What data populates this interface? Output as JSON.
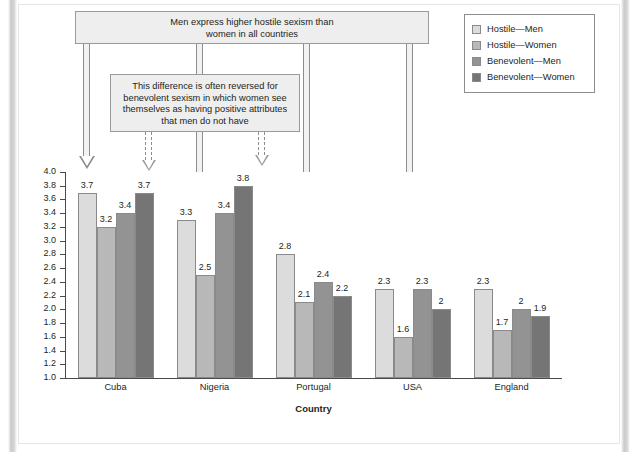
{
  "chart_data": {
    "type": "bar",
    "title": "",
    "xlabel": "Country",
    "ylabel": "Hostile and Benevolent Sexism",
    "categories": [
      "Cuba",
      "Nigeria",
      "Portugal",
      "USA",
      "England"
    ],
    "ylim": [
      1.0,
      4.0
    ],
    "ytick_step": 0.2,
    "yticks": [
      "4.0",
      "3.8",
      "3.6",
      "3.4",
      "3.2",
      "3.0",
      "2.8",
      "2.6",
      "2.4",
      "2.2",
      "2.0",
      "1.8",
      "1.6",
      "1.4",
      "1.2",
      "1.0"
    ],
    "grid": false,
    "legend_position": "top-right",
    "series": [
      {
        "name": "Hostile—Men",
        "color": "#dcdcdc",
        "values": [
          3.7,
          3.3,
          2.8,
          2.3,
          2.3
        ],
        "labels": [
          "3.7",
          "3.3",
          "2.8",
          "2.3",
          "2.3"
        ]
      },
      {
        "name": "Hostile—Women",
        "color": "#b8b8b8",
        "values": [
          3.2,
          2.5,
          2.1,
          1.6,
          1.7
        ],
        "labels": [
          "3.2",
          "2.5",
          "2.1",
          "1.6",
          "1.7"
        ]
      },
      {
        "name": "Benevolent—Men",
        "color": "#939393",
        "values": [
          3.4,
          3.4,
          2.4,
          2.3,
          2.0
        ],
        "labels": [
          "3.4",
          "3.4",
          "2.4",
          "2.3",
          "2"
        ]
      },
      {
        "name": "Benevolent—Women",
        "color": "#757575",
        "values": [
          3.7,
          3.8,
          2.2,
          2.0,
          1.9
        ],
        "labels": [
          "3.7",
          "3.8",
          "2.2",
          "2",
          "1.9"
        ]
      }
    ],
    "annotations": [
      {
        "id": "callout-top",
        "text": "Men express higher hostile sexism than women in all countries"
      },
      {
        "id": "callout-second",
        "text": "This difference is often reversed for benevolent sexism in which women see themselves as having positive attributes that men do not have"
      }
    ]
  },
  "callouts": {
    "top_line1": "Men express higher hostile sexism than",
    "top_line2": "women in all countries",
    "second_line1": "This difference is often reversed for",
    "second_line2": "benevolent sexism in which women see",
    "second_line3": "themselves as having positive attributes",
    "second_line4": "that men do not have"
  },
  "legend": {
    "items": [
      {
        "label": "Hostile—Men",
        "color": "#dcdcdc"
      },
      {
        "label": "Hostile—Women",
        "color": "#b8b8b8"
      },
      {
        "label": "Benevolent—Men",
        "color": "#939393"
      },
      {
        "label": "Benevolent—Women",
        "color": "#757575"
      }
    ]
  },
  "axes": {
    "y_title": "Hostile and Benevolent Sexism",
    "x_title": "Country"
  }
}
